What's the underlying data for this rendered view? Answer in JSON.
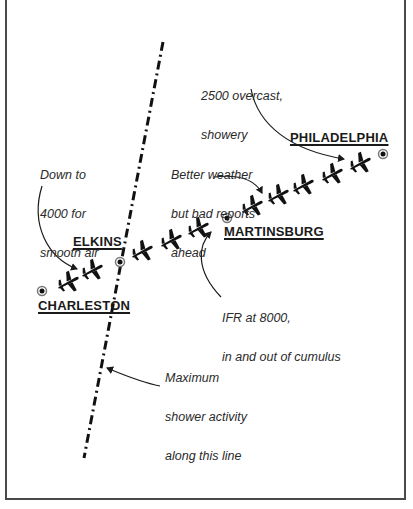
{
  "diagram": {
    "type": "flight-route-weather-map",
    "cities": [
      {
        "id": "charleston",
        "name": "CHARLESTON",
        "x": 42,
        "y": 291
      },
      {
        "id": "elkins",
        "name": "ELKINS",
        "x": 120,
        "y": 262
      },
      {
        "id": "martinsburg",
        "name": "MARTINSBURG",
        "x": 227,
        "y": 218
      },
      {
        "id": "philadelphia",
        "name": "PHILADELPHIA",
        "x": 383,
        "y": 154
      }
    ],
    "weather_front": {
      "style": "dash-dot",
      "label": "Maximum shower activity along this line",
      "start": [
        163,
        42
      ],
      "end": [
        84,
        458
      ]
    },
    "route": {
      "icon": "airplane-icon",
      "plane_count": 10,
      "planes": [
        {
          "x": 68,
          "y": 282
        },
        {
          "x": 92,
          "y": 270
        },
        {
          "x": 142,
          "y": 251
        },
        {
          "x": 171,
          "y": 240
        },
        {
          "x": 198,
          "y": 228
        },
        {
          "x": 252,
          "y": 206
        },
        {
          "x": 278,
          "y": 195
        },
        {
          "x": 303,
          "y": 185
        },
        {
          "x": 332,
          "y": 174
        },
        {
          "x": 360,
          "y": 163
        }
      ]
    },
    "annotations": {
      "descent": {
        "lines": [
          "Down to",
          "4000 for",
          "smooth air"
        ]
      },
      "destination": {
        "lines": [
          "2500 overcast,",
          "showery"
        ]
      },
      "better_weather": {
        "lines": [
          "Better weather",
          "but bad reports",
          "ahead"
        ]
      },
      "ifr": {
        "lines": [
          "IFR at 8000,",
          "in and out of cumulus"
        ]
      },
      "shower_line": {
        "lines": [
          "Maximum",
          "shower activity",
          "along this line"
        ]
      }
    },
    "colors": {
      "ink": "#1a1a1a",
      "background": "#ffffff",
      "frame": "#4a4a4a"
    }
  }
}
